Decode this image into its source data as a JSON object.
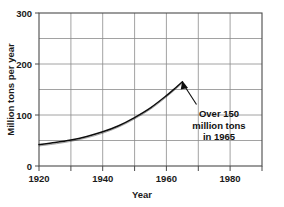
{
  "chart_data": {
    "type": "line",
    "title": "",
    "subtitle": "",
    "xlabel": "Year",
    "ylabel": "Million tons per year",
    "xlim": [
      1920,
      1990
    ],
    "ylim": [
      0,
      300
    ],
    "grid": true,
    "legend": null,
    "x_ticks_major": [
      1920,
      1940,
      1960,
      1980
    ],
    "x_ticks_minor": [
      1930,
      1950,
      1970,
      1990
    ],
    "x_tick_labels": [
      "1920",
      "1940",
      "1960",
      "1980"
    ],
    "y_ticks_major": [
      0,
      100,
      200,
      300
    ],
    "y_ticks_minor": [
      50,
      150,
      250
    ],
    "y_tick_labels": [
      "0",
      "100",
      "200",
      "300"
    ],
    "series": [
      {
        "name": "Production",
        "x": [
          1920,
          1925,
          1930,
          1935,
          1940,
          1945,
          1950,
          1955,
          1960,
          1963,
          1965
        ],
        "values": [
          42,
          46,
          51,
          58,
          67,
          79,
          95,
          114,
          138,
          154,
          165
        ]
      }
    ],
    "annotations": [
      {
        "lines": [
          "Over 150",
          "million tons",
          "in 1965"
        ],
        "target_x": 1965,
        "target_y": 160,
        "text_x": 1970,
        "text_y": 105
      }
    ]
  },
  "axes": {
    "x_axis_title": "Year",
    "y_axis_title": "Million tons per year"
  },
  "annotation": {
    "line1": "Over 150",
    "line2": "million tons",
    "line3": "in 1965"
  },
  "colors": {
    "curve": "#0d0d0d",
    "grid": "#8a8a8a",
    "frame": "#4a4a4a",
    "text": "#1a1a1a",
    "background": "#ffffff"
  }
}
